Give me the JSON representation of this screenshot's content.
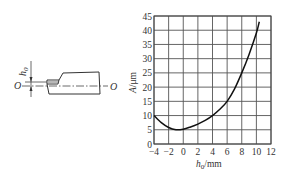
{
  "figure": {
    "left_diagram": {
      "dimension_label": "h",
      "dimension_subscript": "0",
      "axis_label_left": "O",
      "axis_label_right": "O"
    }
  },
  "chart_data": {
    "type": "line",
    "title": "",
    "xlabel": "h0/mm",
    "xlabel_main": "h",
    "xlabel_sub": "0",
    "xlabel_unit": "/mm",
    "ylabel": "A/μm",
    "ylabel_main": "A",
    "ylabel_unit": "/μm",
    "xlim": [
      -4,
      12
    ],
    "ylim": [
      0,
      45
    ],
    "grid": true,
    "legend": null,
    "x_ticks": [
      -4,
      -2,
      0,
      2,
      4,
      6,
      8,
      10,
      12
    ],
    "x_tick_labels": [
      "−4",
      "−2",
      "0",
      "2",
      "4",
      "6",
      "8",
      "10",
      "12"
    ],
    "y_ticks": [
      0,
      5,
      10,
      15,
      20,
      25,
      30,
      35,
      40,
      45
    ],
    "y_tick_labels": [
      "0",
      "5",
      "10",
      "15",
      "20",
      "25",
      "30",
      "35",
      "40",
      "45"
    ],
    "series": [
      {
        "name": "A vs h0",
        "x": [
          -4,
          -3,
          -2,
          -1,
          0,
          1,
          2,
          3,
          4,
          5,
          6,
          7,
          8,
          9,
          10,
          10.4
        ],
        "y": [
          10,
          7.5,
          5.8,
          5.0,
          5.2,
          6.0,
          7.0,
          8.3,
          10,
          12.2,
          15,
          19.3,
          25,
          31.5,
          39,
          43
        ]
      }
    ]
  }
}
